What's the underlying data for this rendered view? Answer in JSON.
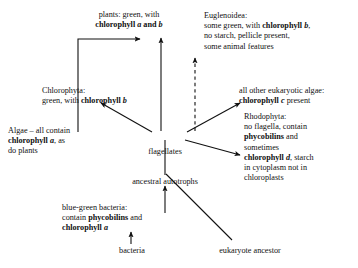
{
  "diagram": {
    "ink_color": "#111111",
    "background": "#ffffff",
    "nodes": {
      "plants": {
        "lines": [
          {
            "segments": [
              {
                "t": "plants: green, with",
                "style": "normal"
              }
            ]
          },
          {
            "segments": [
              {
                "t": "chlorophyll ",
                "style": "bold"
              },
              {
                "t": "a",
                "style": "bold-italic"
              },
              {
                "t": " and ",
                "style": "bold"
              },
              {
                "t": "b",
                "style": "bold-italic"
              }
            ]
          }
        ]
      },
      "euglenoidea": {
        "lines": [
          {
            "segments": [
              {
                "t": "Euglenoidea:",
                "style": "normal"
              }
            ]
          },
          {
            "segments": [
              {
                "t": "some green, with ",
                "style": "normal"
              },
              {
                "t": "chlorophyll ",
                "style": "bold"
              },
              {
                "t": "b",
                "style": "bold-italic"
              },
              {
                "t": ",",
                "style": "normal"
              }
            ]
          },
          {
            "segments": [
              {
                "t": "no starch, pellicle present,",
                "style": "normal"
              }
            ]
          },
          {
            "segments": [
              {
                "t": "some animal features",
                "style": "normal"
              }
            ]
          }
        ]
      },
      "chlorophyta": {
        "lines": [
          {
            "segments": [
              {
                "t": "Chlorophyta:",
                "style": "normal"
              }
            ]
          },
          {
            "segments": [
              {
                "t": "green, with ",
                "style": "normal"
              },
              {
                "t": "chlorophyll ",
                "style": "bold"
              },
              {
                "t": "b",
                "style": "bold-italic"
              }
            ]
          }
        ]
      },
      "other_algae": {
        "lines": [
          {
            "segments": [
              {
                "t": "all other eukaryotic algae:",
                "style": "normal"
              }
            ]
          },
          {
            "segments": [
              {
                "t": "chlorophyll ",
                "style": "bold"
              },
              {
                "t": "c",
                "style": "bold-italic"
              },
              {
                "t": " present",
                "style": "normal"
              }
            ]
          }
        ]
      },
      "rhodophyta": {
        "lines": [
          {
            "segments": [
              {
                "t": "Rhodophyta:",
                "style": "normal"
              }
            ]
          },
          {
            "segments": [
              {
                "t": "no flagella, contain",
                "style": "normal"
              }
            ]
          },
          {
            "segments": [
              {
                "t": "phycobilins",
                "style": "bold"
              },
              {
                "t": " and",
                "style": "normal"
              }
            ]
          },
          {
            "segments": [
              {
                "t": "sometimes",
                "style": "normal"
              }
            ]
          },
          {
            "segments": [
              {
                "t": "chlorophyll ",
                "style": "bold"
              },
              {
                "t": "d",
                "style": "bold-italic"
              },
              {
                "t": ", starch",
                "style": "normal"
              }
            ]
          },
          {
            "segments": [
              {
                "t": "in cytoplasm not in",
                "style": "normal"
              }
            ]
          },
          {
            "segments": [
              {
                "t": "chloroplasts",
                "style": "normal"
              }
            ]
          }
        ]
      },
      "algae_note": {
        "lines": [
          {
            "segments": [
              {
                "t": "Algae – all contain",
                "style": "normal"
              }
            ]
          },
          {
            "segments": [
              {
                "t": "chlorophyll ",
                "style": "bold"
              },
              {
                "t": "a",
                "style": "bold-italic"
              },
              {
                "t": ", as",
                "style": "normal"
              }
            ]
          },
          {
            "segments": [
              {
                "t": "do plants",
                "style": "normal"
              }
            ]
          }
        ]
      },
      "flagellates": {
        "lines": [
          {
            "segments": [
              {
                "t": "flagellates",
                "style": "normal"
              }
            ]
          }
        ]
      },
      "ancestral_autotrophs": {
        "lines": [
          {
            "segments": [
              {
                "t": "ancestral autotrophs",
                "style": "normal"
              }
            ]
          }
        ]
      },
      "blue_green_bacteria": {
        "lines": [
          {
            "segments": [
              {
                "t": "blue-green bacteria:",
                "style": "normal"
              }
            ]
          },
          {
            "segments": [
              {
                "t": "contain ",
                "style": "normal"
              },
              {
                "t": "phycobilins",
                "style": "bold"
              },
              {
                "t": " and",
                "style": "normal"
              }
            ]
          },
          {
            "segments": [
              {
                "t": "chlorophyll ",
                "style": "bold"
              },
              {
                "t": "a",
                "style": "bold-italic"
              }
            ]
          }
        ]
      },
      "bacteria": {
        "lines": [
          {
            "segments": [
              {
                "t": "bacteria",
                "style": "normal"
              }
            ]
          }
        ]
      },
      "eukaryote_ancestor": {
        "lines": [
          {
            "segments": [
              {
                "t": "eukaryote ancestor",
                "style": "normal"
              }
            ]
          }
        ]
      }
    },
    "edges": [
      {
        "from": "flagellates",
        "to": "plants",
        "style": "solid",
        "arrow": true
      },
      {
        "from": "flagellates",
        "to": "euglenoidea",
        "style": "dashed",
        "arrow": true
      },
      {
        "from": "flagellates",
        "to": "chlorophyta",
        "style": "solid",
        "arrow": true
      },
      {
        "from": "flagellates",
        "to": "other_algae",
        "style": "solid",
        "arrow": true
      },
      {
        "from": "flagellates",
        "to": "rhodophyta",
        "style": "solid",
        "arrow": true
      },
      {
        "from": "ancestral_autotrophs",
        "to": "flagellates",
        "style": "solid",
        "arrow": false
      },
      {
        "from": "bacteria",
        "to": "blue_green_bacteria",
        "style": "solid",
        "arrow": true
      },
      {
        "from": "blue_green_bacteria",
        "to": "ancestral_autotrophs",
        "style": "solid",
        "arrow": true
      },
      {
        "from": "eukaryote_ancestor",
        "to": "ancestral_autotrophs",
        "style": "solid",
        "arrow": false
      },
      {
        "from": "algae_note",
        "to": "plants_bracket",
        "style": "solid",
        "arrow": true,
        "shape": "bracket"
      }
    ]
  }
}
